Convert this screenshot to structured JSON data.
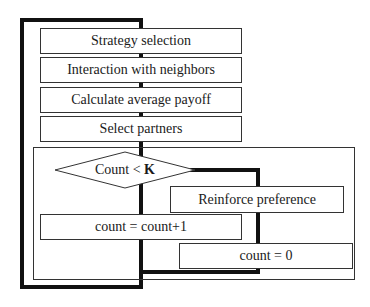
{
  "flowchart": {
    "steps": [
      {
        "label": "Strategy selection"
      },
      {
        "label": "Interaction with neighbors"
      },
      {
        "label": "Calculate average payoff"
      },
      {
        "label": "Select partners"
      }
    ],
    "decision": {
      "label": "Count < ",
      "bold_part": "K"
    },
    "branch_true": {
      "label": "count = count+1"
    },
    "branch_false": [
      {
        "label": "Reinforce preference"
      },
      {
        "label": "count = 0"
      }
    ]
  }
}
